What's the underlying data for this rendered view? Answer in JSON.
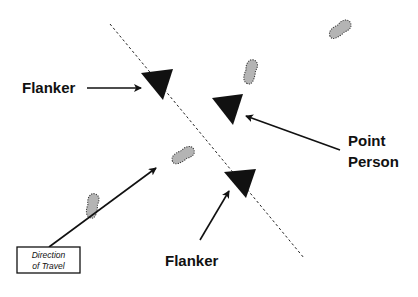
{
  "diagram": {
    "labels": {
      "flanker_top": "Flanker",
      "point_line1": "Point",
      "point_line2": "Person",
      "flanker_bottom": "Flanker",
      "direction_line1": "Direction",
      "direction_line2": "of Travel"
    },
    "icons": {
      "person_marker": "black-triangle",
      "footprint": "gray-footprint-dotted",
      "path_line": "dashed-line"
    },
    "colors": {
      "marker": "#111111",
      "footprint_fill": "#b4b4b4",
      "footprint_stroke": "#333333",
      "line": "#222222",
      "background": "#ffffff"
    }
  }
}
